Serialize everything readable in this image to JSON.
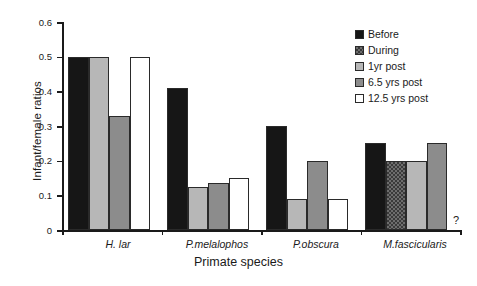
{
  "chart_data": {
    "type": "bar",
    "title": "",
    "xlabel": "Primate species",
    "ylabel": "Infant/female ratios",
    "ylim": [
      0,
      0.6
    ],
    "yticks": [
      "0",
      "0.1",
      "0.2",
      "0.3",
      "0.4",
      "0.5",
      "0.6"
    ],
    "ytick_values": [
      0,
      0.1,
      0.2,
      0.3,
      0.4,
      0.5,
      0.6
    ],
    "grid": false,
    "legend_position": "top-right",
    "categories": [
      "H. lar",
      "P.melalophos",
      "P.obscura",
      "M.fascicularis"
    ],
    "series": [
      {
        "name": "Before",
        "color": "#161616",
        "values": [
          0.5,
          0.41,
          0.3,
          0.25
        ]
      },
      {
        "name": "During",
        "color": "#6d6d6d",
        "values": [
          null,
          null,
          null,
          0.2
        ]
      },
      {
        "name": "1yr post",
        "color": "#b7b7b7",
        "values": [
          0.5,
          0.125,
          0.09,
          0.2
        ]
      },
      {
        "name": "6.5 yrs post",
        "color": "#8c8c8c",
        "values": [
          0.33,
          0.135,
          0.2,
          0.25
        ]
      },
      {
        "name": "12.5 yrs post",
        "color": "#ffffff",
        "values": [
          0.5,
          0.15,
          0.09,
          null
        ]
      }
    ],
    "annotations": [
      {
        "text": "?",
        "category": "M.fascicularis",
        "series": "12.5 yrs post"
      }
    ]
  },
  "legend": {
    "items": [
      {
        "label": "Before",
        "swatch": "sw-before"
      },
      {
        "label": "During",
        "swatch": "sw-during"
      },
      {
        "label": "1yr post",
        "swatch": "sw-1yr"
      },
      {
        "label": "6.5 yrs post",
        "swatch": "sw-65yr"
      },
      {
        "label": "12.5 yrs post",
        "swatch": "sw-125yr"
      }
    ]
  }
}
